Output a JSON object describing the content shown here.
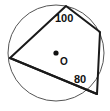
{
  "figure": {
    "type": "geometry-diagram",
    "background_color": "#ffffff",
    "stroke_color": "#1a1a1a",
    "circle_stroke_color": "#555555",
    "label_color": "#111111"
  },
  "circle": {
    "name": "circumscribed-circle",
    "center_x": 56,
    "center_y": 53,
    "radius": 48,
    "stroke_width": 1
  },
  "center_point": {
    "name": "center-point",
    "x": 56,
    "y": 53,
    "dot_radius": 2.6,
    "label": "O"
  },
  "quadrilateral": {
    "name": "inscribed-quadrilateral",
    "stroke_width": 2,
    "fill": "none",
    "vertices": [
      {
        "name": "vertex-top",
        "x": 66,
        "y": 6
      },
      {
        "name": "vertex-right",
        "x": 100,
        "y": 32
      },
      {
        "name": "vertex-bottom-right",
        "x": 97,
        "y": 94
      },
      {
        "name": "vertex-left",
        "x": 10,
        "y": 58
      }
    ]
  },
  "diagonal": {
    "name": "diagonal-left-to-bottom-right",
    "from": "vertex-left",
    "to": "vertex-bottom-right",
    "stroke_width": 2
  },
  "labels": {
    "angle_top": {
      "name": "angle-label-100",
      "text": "100",
      "x": 55,
      "y": 13
    },
    "angle_bottom_right": {
      "name": "angle-label-80",
      "text": "80",
      "x": 74,
      "y": 74
    },
    "center": {
      "name": "center-label-O",
      "text": "O",
      "x": 60,
      "y": 57
    }
  }
}
